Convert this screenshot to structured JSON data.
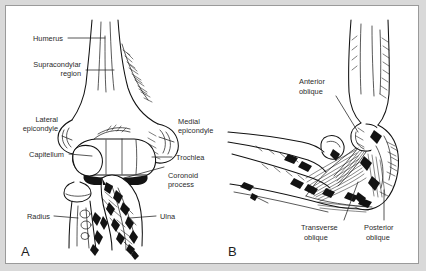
{
  "figure": {
    "background_color": "#d9d9d9",
    "plate_color": "#ffffff",
    "border_color": "#9a9a9a",
    "ink_color": "#121212",
    "label_color": "#2b2b2b",
    "style": "black-and-white medical line drawing"
  },
  "panels": [
    {
      "letter": "A",
      "name": "anterior-bony-anatomy",
      "labels": [
        {
          "id": "humerus",
          "text": "Humerus"
        },
        {
          "id": "supracondylar",
          "text": "Supracondylar",
          "text2": "region"
        },
        {
          "id": "lateral-epicondyle",
          "text": "Lateral",
          "text2": "epicondyle"
        },
        {
          "id": "capitellum",
          "text": "Capitellum"
        },
        {
          "id": "medial-epicondyle",
          "text": "Medial",
          "text2": "epicondyle"
        },
        {
          "id": "trochlea",
          "text": "Trochlea"
        },
        {
          "id": "coronoid-process",
          "text": "Coronoid",
          "text2": "process"
        },
        {
          "id": "radius",
          "text": "Radius"
        },
        {
          "id": "ulna",
          "text": "Ulna"
        }
      ]
    },
    {
      "letter": "B",
      "name": "medial-collateral-ligament-complex",
      "labels": [
        {
          "id": "anterior-oblique",
          "text": "Anterior",
          "text2": "oblique"
        },
        {
          "id": "transverse-oblique",
          "text": "Transverse",
          "text2": "oblique"
        },
        {
          "id": "posterior-oblique",
          "text": "Posterior",
          "text2": "oblique"
        }
      ]
    }
  ]
}
